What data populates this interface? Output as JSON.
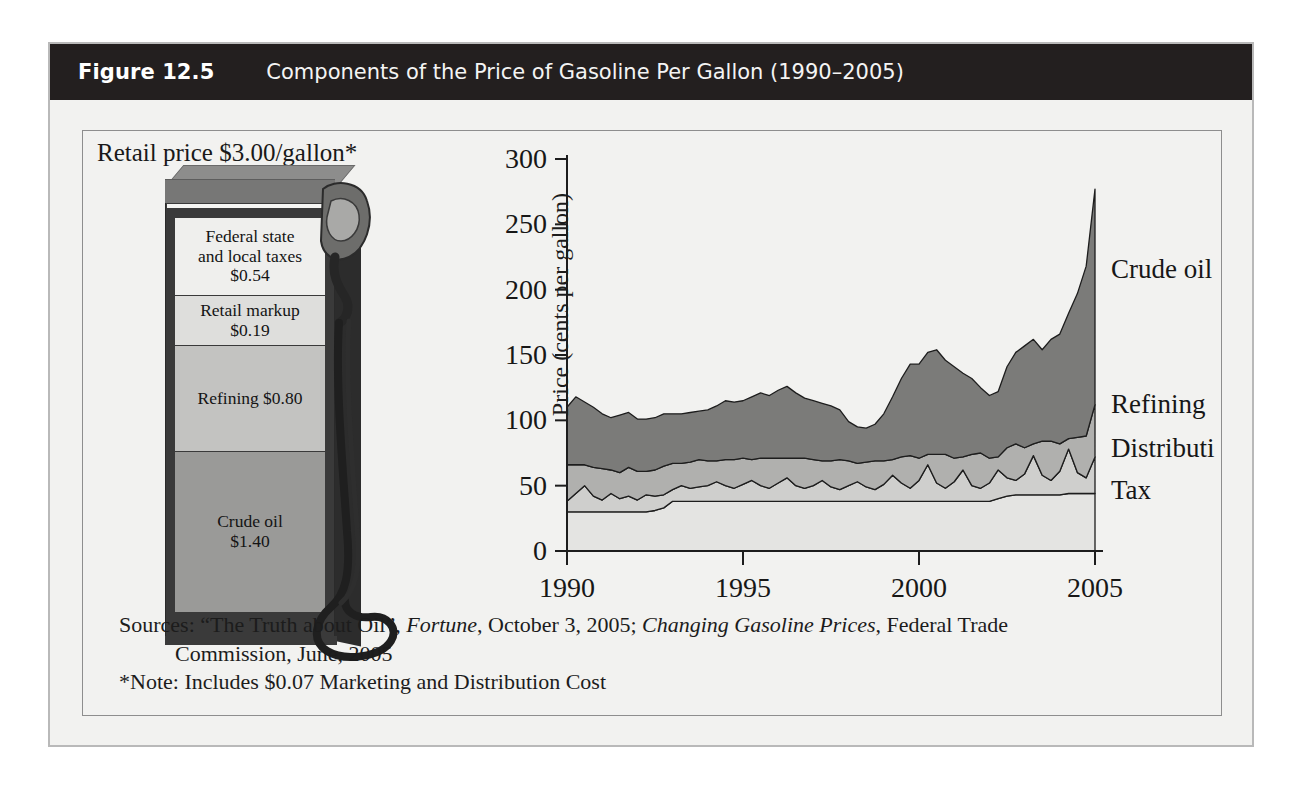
{
  "figure": {
    "number": "Figure 12.5",
    "title": "Components of the Price of Gasoline Per Gallon (1990–2005)"
  },
  "pump": {
    "retail_caption": "Retail price $3.00/gallon*",
    "segments": [
      {
        "label": "Federal state\nand local taxes\n$0.54",
        "name": "Federal state and local taxes",
        "value": "$0.54",
        "color": "#efefed"
      },
      {
        "label": "Retail markup\n$0.19",
        "name": "Retail markup",
        "value": "$0.19",
        "color": "#dededc"
      },
      {
        "label": "Refining $0.80",
        "name": "Refining",
        "value": "$0.80",
        "color": "#c3c3c1"
      },
      {
        "label": "Crude oil\n$1.40",
        "name": "Crude oil",
        "value": "$1.40",
        "color": "#9a9a98"
      }
    ]
  },
  "sources": {
    "line1_prefix": "Sources: “The Truth about Oil”, ",
    "line1_ital1": "Fortune",
    "line1_mid": ", October 3, 2005; ",
    "line1_ital2": "Changing Gasoline Prices",
    "line1_suffix": ", Federal Trade",
    "line2": "Commission, June, 2005",
    "line3": "*Note: Includes $0.07 Marketing and Distribution Cost"
  },
  "chart_data": {
    "type": "area",
    "title": "Components of the Price of Gasoline Per Gallon (1990–2005)",
    "xlabel": "",
    "ylabel": "Price (cents per gallon)",
    "xlim": [
      1990,
      2005
    ],
    "ylim": [
      0,
      300
    ],
    "yticks": [
      0,
      50,
      100,
      150,
      200,
      250,
      300
    ],
    "xticks": [
      1990,
      1995,
      2000,
      2005
    ],
    "grid": false,
    "stacked": true,
    "legend_position": "right-inline",
    "series_order_bottom_to_top": [
      "Tax",
      "Distribution",
      "Refining",
      "Crude oil"
    ],
    "colors": {
      "Tax": "#e4e4e2",
      "Distribution": "#cfcfcd",
      "Refining": "#b0b0ae",
      "Crude oil": "#7b7b79"
    },
    "x": [
      1990.0,
      1990.25,
      1990.5,
      1990.75,
      1991.0,
      1991.25,
      1991.5,
      1991.75,
      1992.0,
      1992.25,
      1992.5,
      1992.75,
      1993.0,
      1993.25,
      1993.5,
      1993.75,
      1994.0,
      1994.25,
      1994.5,
      1994.75,
      1995.0,
      1995.25,
      1995.5,
      1995.75,
      1996.0,
      1996.25,
      1996.5,
      1996.75,
      1997.0,
      1997.25,
      1997.5,
      1997.75,
      1998.0,
      1998.25,
      1998.5,
      1998.75,
      1999.0,
      1999.25,
      1999.5,
      1999.75,
      2000.0,
      2000.25,
      2000.5,
      2000.75,
      2001.0,
      2001.25,
      2001.5,
      2001.75,
      2002.0,
      2002.25,
      2002.5,
      2002.75,
      2003.0,
      2003.25,
      2003.5,
      2003.75,
      2004.0,
      2004.25,
      2004.5,
      2004.75,
      2005.0
    ],
    "series": [
      {
        "name": "Tax",
        "values": [
          30,
          30,
          30,
          30,
          30,
          30,
          30,
          30,
          30,
          30,
          31,
          33,
          38,
          38,
          38,
          38,
          38,
          38,
          38,
          38,
          38,
          38,
          38,
          38,
          38,
          38,
          38,
          38,
          38,
          38,
          38,
          38,
          38,
          38,
          38,
          38,
          38,
          38,
          38,
          38,
          38,
          38,
          38,
          38,
          38,
          38,
          38,
          38,
          38,
          40,
          42,
          43,
          43,
          43,
          43,
          43,
          43,
          44,
          44,
          44,
          44
        ]
      },
      {
        "name": "Distribution",
        "values": [
          8,
          14,
          20,
          12,
          9,
          14,
          10,
          12,
          9,
          13,
          11,
          10,
          9,
          12,
          10,
          11,
          12,
          15,
          12,
          10,
          13,
          16,
          12,
          10,
          14,
          18,
          12,
          10,
          12,
          16,
          11,
          9,
          12,
          15,
          11,
          9,
          13,
          20,
          14,
          10,
          16,
          28,
          14,
          10,
          15,
          24,
          12,
          10,
          14,
          22,
          14,
          11,
          16,
          30,
          15,
          11,
          18,
          34,
          16,
          12,
          28
        ]
      },
      {
        "name": "Refining",
        "values": [
          28,
          22,
          16,
          22,
          24,
          18,
          20,
          22,
          22,
          18,
          20,
          22,
          20,
          17,
          20,
          21,
          19,
          16,
          20,
          22,
          20,
          16,
          21,
          23,
          19,
          15,
          21,
          23,
          20,
          15,
          20,
          23,
          19,
          14,
          19,
          22,
          18,
          12,
          20,
          25,
          17,
          8,
          22,
          26,
          18,
          10,
          24,
          27,
          19,
          10,
          23,
          28,
          20,
          9,
          26,
          30,
          21,
          8,
          27,
          32,
          40
        ]
      },
      {
        "name": "Crude oil",
        "values": [
          44,
          52,
          48,
          46,
          42,
          40,
          44,
          42,
          40,
          40,
          40,
          40,
          38,
          38,
          38,
          37,
          39,
          42,
          45,
          44,
          44,
          48,
          50,
          48,
          52,
          55,
          50,
          46,
          45,
          44,
          42,
          38,
          30,
          28,
          26,
          28,
          36,
          48,
          60,
          70,
          72,
          78,
          80,
          72,
          70,
          64,
          58,
          50,
          48,
          50,
          62,
          70,
          78,
          80,
          70,
          78,
          84,
          96,
          110,
          130,
          165
        ]
      }
    ],
    "annotations": [
      {
        "text": "Crude oil",
        "x": 2005.3,
        "y": 215
      },
      {
        "text": "Refining",
        "x": 2005.3,
        "y": 112
      },
      {
        "text": "Distribution",
        "x": 2005.3,
        "y": 78
      },
      {
        "text": "Tax",
        "x": 2005.3,
        "y": 46
      }
    ]
  }
}
